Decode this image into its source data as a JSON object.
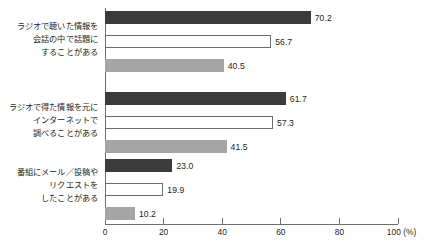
{
  "chart_data": {
    "type": "bar",
    "orientation": "horizontal",
    "title": "",
    "xlabel": "",
    "ylabel": "",
    "xlim": [
      0,
      100
    ],
    "xticks": [
      0,
      20,
      40,
      60,
      80,
      100
    ],
    "xtick_labels": [
      "0",
      "20",
      "40",
      "60",
      "80",
      "100 (%)"
    ],
    "grid": false,
    "legend": "none",
    "categories": [
      "ラジオで聴いた情報を\n会話の中で話題に\nすることがある",
      "ラジオで得た情報を元に\nインターネットで\n調べることがある",
      "番組にメール／投稿や\nリクエストを\nしたことがある"
    ],
    "series": [
      {
        "name": "series-1",
        "values": [
          70.2,
          61.7,
          23.0
        ],
        "color": "#3b3b3b"
      },
      {
        "name": "series-2",
        "values": [
          56.7,
          57.3,
          19.9
        ],
        "color": "#ffffff"
      },
      {
        "name": "series-3",
        "values": [
          40.5,
          41.5,
          10.2
        ],
        "color": "#a5a5a5"
      }
    ],
    "value_labels": [
      [
        "70.2",
        "56.7",
        "40.5"
      ],
      [
        "61.7",
        "57.3",
        "41.5"
      ],
      [
        "23.0",
        "19.9",
        "10.2"
      ]
    ]
  },
  "axis": {
    "unit_suffix": "(%)",
    "axis_color": "#6e6e6e",
    "text_color": "#231f20"
  }
}
